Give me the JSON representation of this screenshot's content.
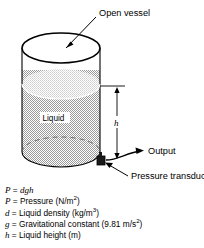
{
  "figure": {
    "title_label": "Open vessel",
    "vessel": {
      "liquid_label": "Liquid",
      "fill_color": "#c9c9c9",
      "surface_color": "#dcdcdc",
      "outline_color": "#000000"
    },
    "dimension": {
      "height_symbol": "h"
    },
    "callouts": [
      {
        "name": "open-vessel",
        "label": "Open vessel"
      },
      {
        "name": "output",
        "label": "Output"
      },
      {
        "name": "pressure-transducer",
        "label": "Pressure transducer"
      }
    ],
    "output_label": "Output",
    "transducer_label": "Pressure transducer"
  },
  "legend": {
    "equation": {
      "symbol": "P",
      "equals": "=",
      "expression": "dgh"
    },
    "definitions": [
      {
        "symbol": "P",
        "equals": "=",
        "text_before": "Pressure (N/m",
        "superscript": "2",
        "text_after": ")"
      },
      {
        "symbol": "d",
        "equals": "=",
        "text_before": "Liquid density (kg/m",
        "superscript": "3",
        "text_after": ")"
      },
      {
        "symbol": "g",
        "equals": "=",
        "text_before": "Gravitational constant (9.81 m/s",
        "superscript": "2",
        "text_after": ")"
      },
      {
        "symbol": "h",
        "equals": "=",
        "text_before": "Liquid height (m)",
        "superscript": "",
        "text_after": ""
      }
    ]
  }
}
